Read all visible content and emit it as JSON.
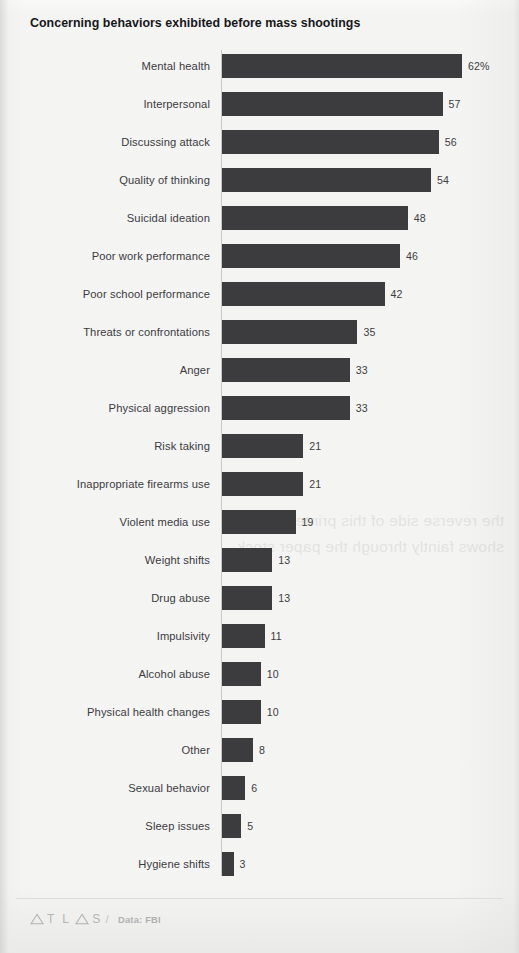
{
  "chart_data": {
    "type": "bar",
    "orientation": "horizontal",
    "title": "Concerning behaviors exhibited before mass shootings",
    "xlabel": "",
    "ylabel": "",
    "xlim": [
      0,
      62
    ],
    "grid": false,
    "legend": null,
    "value_suffix_first": "%",
    "categories": [
      "Mental health",
      "Interpersonal",
      "Discussing attack",
      "Quality of thinking",
      "Suicidal ideation",
      "Poor work performance",
      "Poor school performance",
      "Threats or confrontations",
      "Anger",
      "Physical aggression",
      "Risk taking",
      "Inappropriate firearms use",
      "Violent media use",
      "Weight shifts",
      "Drug abuse",
      "Impulsivity",
      "Alcohol abuse",
      "Physical health changes",
      "Other",
      "Sexual behavior",
      "Sleep issues",
      "Hygiene shifts"
    ],
    "values": [
      62,
      57,
      56,
      54,
      48,
      46,
      42,
      35,
      33,
      33,
      21,
      21,
      19,
      13,
      13,
      11,
      10,
      10,
      8,
      6,
      5,
      3
    ],
    "value_labels": [
      "62%",
      "57",
      "56",
      "54",
      "48",
      "46",
      "42",
      "35",
      "33",
      "33",
      "21",
      "21",
      "19",
      "13",
      "13",
      "11",
      "10",
      "10",
      "8",
      "6",
      "5",
      "3"
    ],
    "bar_color": "#3c3c3e",
    "background_color": "#f4f4f3"
  },
  "footer": {
    "brand": "ATLAS",
    "separator": "/",
    "source": "Data: FBI"
  },
  "bleed_through_text": "the reverse side of this printed page shows faintly through the paper stock"
}
